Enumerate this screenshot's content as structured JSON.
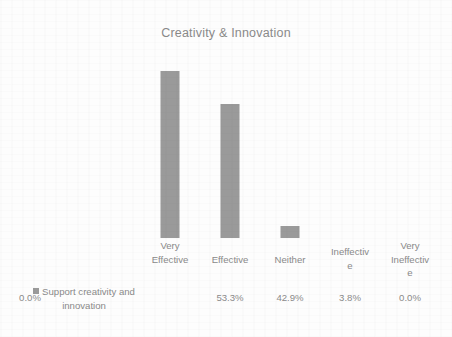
{
  "chart_data": {
    "type": "bar",
    "title": "Creativity & Innovation",
    "xlabel": "",
    "ylabel": "",
    "grid": false,
    "legend_position": "bottom-left",
    "ylim": [
      0,
      60
    ],
    "categories": [
      "Very Effective",
      "Effective",
      "Neither",
      "Ineffective",
      "Very Ineffective"
    ],
    "category_display": [
      "Very\nEffective",
      "Effective",
      "Neither",
      "Ineffectiv\ne",
      "Very\nIneffectiv\ne"
    ],
    "series": [
      {
        "name": "Support creativity and innovation",
        "values": [
          53.3,
          42.9,
          3.8,
          0.0,
          0.0
        ],
        "value_labels": [
          "53.3%",
          "42.9%",
          "3.8%",
          "0.0%",
          "0.0%"
        ],
        "color": "#9a9a9a"
      }
    ],
    "bar_heights_px": [
      167,
      134,
      12,
      0,
      0
    ],
    "colors": {
      "bar": "#9a9a9a",
      "text": "#8a8a8a",
      "title": "#8a8a8a",
      "background": "#fdfdfd"
    }
  },
  "title": {
    "text": "Creativity & Innovation"
  },
  "categories": {
    "items": [
      {
        "line1": "Very",
        "line2": "Effective"
      },
      {
        "line1": "Effective",
        "line2": ""
      },
      {
        "line1": "Neither",
        "line2": ""
      },
      {
        "line1": "Ineffectiv",
        "line2": "e"
      },
      {
        "line1": "Very",
        "line2": "Ineffectiv",
        "line3": "e"
      }
    ]
  },
  "legend": {
    "label_line1": "Support creativity and",
    "label_line2": "innovation"
  },
  "values": {
    "items": [
      "53.3%",
      "42.9%",
      "3.8%",
      "0.0%",
      "0.0%"
    ]
  }
}
